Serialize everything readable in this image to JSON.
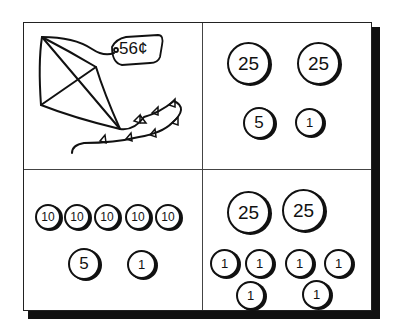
{
  "diagram": {
    "price_tag": "56¢",
    "item": "kite",
    "quadrants": [
      {
        "id": "top-left",
        "content": "kite with price tag",
        "label": "56¢"
      },
      {
        "id": "top-right",
        "coins": [
          "25",
          "25",
          "5",
          "1"
        ]
      },
      {
        "id": "bottom-left",
        "coins": [
          "10",
          "10",
          "10",
          "10",
          "10",
          "5",
          "1"
        ]
      },
      {
        "id": "bottom-right",
        "coins": [
          "25",
          "25",
          "1",
          "1",
          "1",
          "1",
          "1",
          "1"
        ]
      }
    ]
  }
}
